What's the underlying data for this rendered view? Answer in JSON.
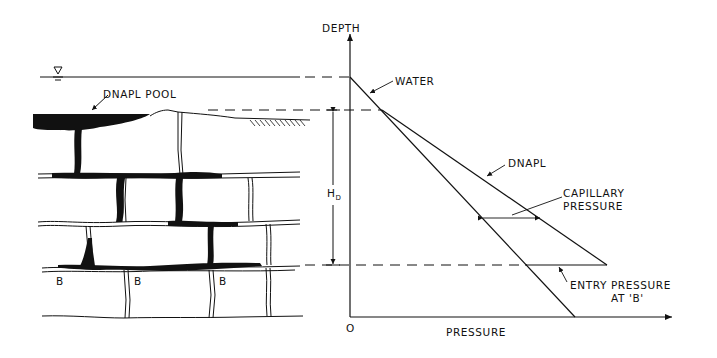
{
  "figure": {
    "left_panel": {
      "water_table_symbol": "water-table-triangle",
      "pool_label": "DNAPL POOL",
      "fracture_labels": [
        "B",
        "B",
        "B"
      ],
      "height_label": "H",
      "height_subscript": "D"
    },
    "right_panel": {
      "y_axis_label": "DEPTH",
      "x_axis_label": "PRESSURE",
      "origin_label": "O",
      "curves": {
        "water": "WATER",
        "dnapl": "DNAPL"
      },
      "annotations": {
        "capillary_line1": "CAPILLARY",
        "capillary_line2": "PRESSURE",
        "entry_line1": "ENTRY PRESSURE",
        "entry_line2": "AT 'B'"
      }
    }
  },
  "colors": {
    "ink": "#111111",
    "background": "#ffffff"
  }
}
